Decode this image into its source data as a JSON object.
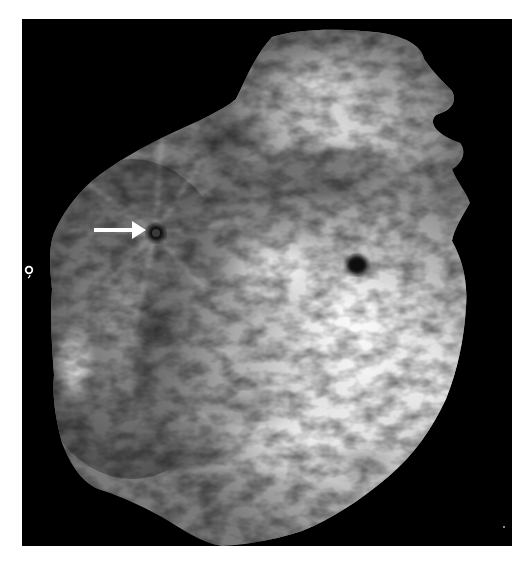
{
  "image": {
    "description": "Grayscale mammogram-style image on a black background showing breast tissue with two dark spiculated lesions; a white arrow points to the left lesion.",
    "modality": "mammogram",
    "colors": {
      "background": "#ffffff",
      "panel": "#000000",
      "tissue_bright": "#f2f2f2",
      "tissue_mid": "#9a9a9a",
      "tissue_dark": "#4a4a4a",
      "lesion": "#111111",
      "arrow": "#ffffff"
    },
    "annotations": {
      "arrow": {
        "direction": "right",
        "points_to": "left-lesion"
      },
      "marker_text": "o,"
    },
    "findings": [
      {
        "name": "left-lesion",
        "shape": "spiculated",
        "position": "upper-left of center",
        "annotated": true
      },
      {
        "name": "right-lesion",
        "shape": "spiculated",
        "position": "right of center",
        "annotated": false
      }
    ]
  }
}
